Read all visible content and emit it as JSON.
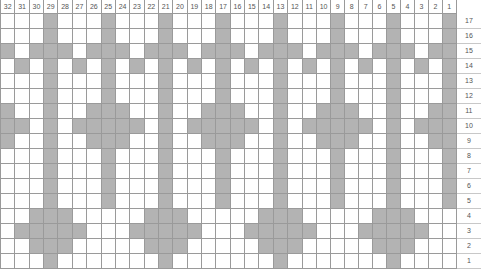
{
  "title": "Chart A Pattern",
  "colors": {
    "filled_cell": "#b3b3b3",
    "empty_cell": "#ffffff",
    "grid_line": "#9a9a9a",
    "label_text": "#555555",
    "title_text": "#2b2b2b"
  },
  "chart_data": {
    "type": "heatmap",
    "title": "Chart A Pattern",
    "xlabel": "",
    "ylabel": "",
    "grid": true,
    "legend_position": "none",
    "column_count": 32,
    "row_count": 17,
    "column_labels": [
      "32",
      "31",
      "30",
      "29",
      "28",
      "27",
      "26",
      "25",
      "24",
      "23",
      "22",
      "21",
      "20",
      "19",
      "18",
      "17",
      "16",
      "15",
      "14",
      "13",
      "12",
      "11",
      "10",
      "9",
      "8",
      "7",
      "6",
      "5",
      "4",
      "3",
      "2",
      "1"
    ],
    "row_labels": [
      "17",
      "16",
      "15",
      "14",
      "13",
      "12",
      "11",
      "10",
      "9",
      "8",
      "7",
      "6",
      "5",
      "4",
      "3",
      "2",
      "1"
    ],
    "value_meaning": {
      "1": "filled stitch (contrast colour)",
      "0": "empty stitch (background colour)"
    },
    "rows": [
      {
        "label": "17",
        "values": [
          0,
          0,
          0,
          1,
          0,
          0,
          0,
          1,
          0,
          0,
          0,
          1,
          0,
          0,
          0,
          1,
          0,
          0,
          0,
          1,
          0,
          0,
          0,
          1,
          0,
          0,
          0,
          1,
          0,
          0,
          0,
          1
        ]
      },
      {
        "label": "16",
        "values": [
          0,
          0,
          0,
          1,
          0,
          0,
          0,
          1,
          0,
          0,
          0,
          1,
          0,
          0,
          0,
          1,
          0,
          0,
          0,
          1,
          0,
          0,
          0,
          1,
          0,
          0,
          0,
          1,
          0,
          0,
          0,
          1
        ]
      },
      {
        "label": "15",
        "values": [
          1,
          0,
          1,
          1,
          1,
          0,
          1,
          1,
          1,
          0,
          1,
          1,
          1,
          0,
          1,
          1,
          1,
          0,
          1,
          1,
          1,
          0,
          1,
          1,
          1,
          0,
          1,
          1,
          1,
          0,
          1,
          1
        ]
      },
      {
        "label": "14",
        "values": [
          0,
          1,
          0,
          1,
          0,
          1,
          0,
          1,
          0,
          1,
          0,
          1,
          0,
          1,
          0,
          1,
          0,
          1,
          0,
          1,
          0,
          1,
          0,
          1,
          0,
          1,
          0,
          1,
          0,
          1,
          0,
          1
        ]
      },
      {
        "label": "13",
        "values": [
          0,
          0,
          0,
          1,
          0,
          0,
          0,
          1,
          0,
          0,
          0,
          1,
          0,
          0,
          0,
          1,
          0,
          0,
          0,
          1,
          0,
          0,
          0,
          1,
          0,
          0,
          0,
          1,
          0,
          0,
          0,
          1
        ]
      },
      {
        "label": "12",
        "values": [
          0,
          0,
          0,
          1,
          0,
          0,
          0,
          1,
          0,
          0,
          0,
          1,
          0,
          0,
          0,
          1,
          0,
          0,
          0,
          1,
          0,
          0,
          0,
          1,
          0,
          0,
          0,
          1,
          0,
          0,
          0,
          1
        ]
      },
      {
        "label": "11",
        "values": [
          1,
          0,
          0,
          1,
          0,
          0,
          1,
          1,
          1,
          0,
          0,
          1,
          0,
          0,
          1,
          1,
          1,
          0,
          0,
          1,
          0,
          0,
          1,
          1,
          1,
          0,
          0,
          1,
          0,
          0,
          1,
          1
        ]
      },
      {
        "label": "10",
        "values": [
          1,
          1,
          0,
          1,
          0,
          1,
          1,
          1,
          1,
          1,
          0,
          1,
          0,
          1,
          1,
          1,
          1,
          1,
          0,
          1,
          0,
          1,
          1,
          1,
          1,
          1,
          0,
          1,
          0,
          1,
          1,
          1
        ]
      },
      {
        "label": "9",
        "values": [
          1,
          0,
          0,
          1,
          0,
          0,
          1,
          1,
          1,
          0,
          0,
          1,
          0,
          0,
          1,
          1,
          1,
          0,
          0,
          1,
          0,
          0,
          1,
          1,
          1,
          0,
          0,
          1,
          0,
          0,
          1,
          1
        ]
      },
      {
        "label": "8",
        "values": [
          0,
          0,
          0,
          1,
          0,
          0,
          0,
          1,
          0,
          0,
          0,
          1,
          0,
          0,
          0,
          1,
          0,
          0,
          0,
          1,
          0,
          0,
          0,
          1,
          0,
          0,
          0,
          1,
          0,
          0,
          0,
          1
        ]
      },
      {
        "label": "7",
        "values": [
          0,
          0,
          0,
          1,
          0,
          0,
          0,
          1,
          0,
          0,
          0,
          1,
          0,
          0,
          0,
          1,
          0,
          0,
          0,
          1,
          0,
          0,
          0,
          1,
          0,
          0,
          0,
          1,
          0,
          0,
          0,
          1
        ]
      },
      {
        "label": "6",
        "values": [
          0,
          0,
          0,
          1,
          0,
          0,
          0,
          1,
          0,
          0,
          0,
          1,
          0,
          0,
          0,
          1,
          0,
          0,
          0,
          1,
          0,
          0,
          0,
          1,
          0,
          0,
          0,
          1,
          0,
          0,
          0,
          1
        ]
      },
      {
        "label": "5",
        "values": [
          0,
          0,
          0,
          1,
          0,
          0,
          0,
          1,
          0,
          0,
          0,
          1,
          0,
          0,
          0,
          1,
          0,
          0,
          0,
          1,
          0,
          0,
          0,
          1,
          0,
          0,
          0,
          1,
          0,
          0,
          0,
          1
        ]
      },
      {
        "label": "4",
        "values": [
          0,
          0,
          1,
          1,
          1,
          0,
          0,
          0,
          0,
          0,
          1,
          1,
          1,
          0,
          0,
          0,
          0,
          0,
          1,
          1,
          1,
          0,
          0,
          0,
          0,
          0,
          1,
          1,
          1,
          0,
          0,
          0
        ]
      },
      {
        "label": "3",
        "values": [
          0,
          1,
          1,
          1,
          1,
          1,
          0,
          0,
          0,
          1,
          1,
          1,
          1,
          1,
          0,
          0,
          0,
          1,
          1,
          1,
          1,
          1,
          0,
          0,
          0,
          1,
          1,
          1,
          1,
          1,
          0,
          0
        ]
      },
      {
        "label": "2",
        "values": [
          0,
          0,
          1,
          1,
          1,
          0,
          0,
          0,
          0,
          0,
          1,
          1,
          1,
          0,
          0,
          0,
          0,
          0,
          1,
          1,
          1,
          0,
          0,
          0,
          0,
          0,
          1,
          1,
          1,
          0,
          0,
          0
        ]
      },
      {
        "label": "1",
        "values": [
          0,
          0,
          0,
          1,
          0,
          0,
          0,
          0,
          0,
          0,
          0,
          1,
          0,
          0,
          0,
          0,
          0,
          0,
          0,
          1,
          0,
          0,
          0,
          0,
          0,
          0,
          0,
          1,
          0,
          0,
          0,
          0
        ]
      }
    ]
  }
}
